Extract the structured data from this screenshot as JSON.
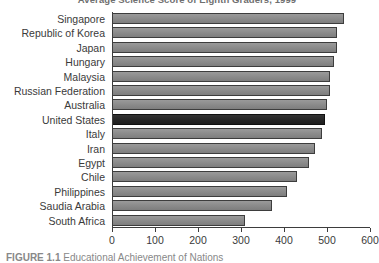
{
  "chart_data": {
    "type": "bar",
    "orientation": "horizontal",
    "title": "Average Science Score of Eighth Graders, 1999",
    "xlabel": "",
    "ylabel": "",
    "xlim": [
      0,
      600
    ],
    "xticks": [
      0,
      100,
      200,
      300,
      400,
      500,
      600
    ],
    "grid": false,
    "legend": null,
    "highlight_category": "United States",
    "categories": [
      "Singapore",
      "Republic of Korea",
      "Japan",
      "Hungary",
      "Malaysia",
      "Russian Federation",
      "Australia",
      "United States",
      "Italy",
      "Iran",
      "Egypt",
      "Chile",
      "Philippines",
      "Saudia Arabia",
      "South Africa"
    ],
    "values": [
      540,
      523,
      523,
      517,
      507,
      507,
      500,
      495,
      488,
      472,
      458,
      430,
      407,
      372,
      309
    ]
  },
  "caption": {
    "fig_number": "FIGURE 1.1",
    "text": "Educational Achievement of Nations"
  },
  "colors": {
    "bar": "#8c8c8c",
    "bar_highlight": "#2b2b2b",
    "axis": "#3d3d3d",
    "text": "#3a3a3a",
    "background": "#ffffff"
  }
}
